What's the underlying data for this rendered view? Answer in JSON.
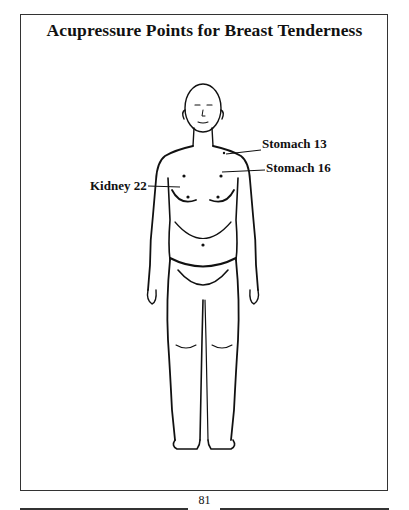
{
  "page": {
    "title": "Acupressure Points for Breast Tenderness",
    "page_number": "81"
  },
  "figure": {
    "points": [
      {
        "label": "Stomach 13"
      },
      {
        "label": "Stomach 16"
      },
      {
        "label": "Kidney 22"
      }
    ]
  }
}
